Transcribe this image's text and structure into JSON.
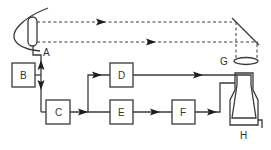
{
  "diagram": {
    "type": "block-flow-optical-schematic",
    "colors": {
      "line": "#3a3a3a",
      "arrow": "#1e1e1e",
      "background": "#ffffff",
      "text": "#333333"
    },
    "labels": {
      "A": "A",
      "B": "B",
      "C": "C",
      "D": "D",
      "E": "E",
      "F": "F",
      "G": "G",
      "H": "H"
    },
    "nodes": [
      {
        "id": "A",
        "kind": "junction-label"
      },
      {
        "id": "B",
        "kind": "box"
      },
      {
        "id": "C",
        "kind": "box"
      },
      {
        "id": "D",
        "kind": "box"
      },
      {
        "id": "E",
        "kind": "box"
      },
      {
        "id": "F",
        "kind": "box"
      },
      {
        "id": "G",
        "kind": "lens"
      },
      {
        "id": "H",
        "kind": "apparatus"
      }
    ],
    "edges": [
      {
        "from": "B",
        "to": "A",
        "style": "solid",
        "arrow": "up"
      },
      {
        "from": "B",
        "to": "C",
        "style": "solid",
        "arrow": "down"
      },
      {
        "from": "C",
        "to": "D",
        "style": "solid",
        "arrow": "right"
      },
      {
        "from": "C",
        "to": "E",
        "style": "solid",
        "arrow": "right"
      },
      {
        "from": "E",
        "to": "F",
        "style": "solid",
        "arrow": "right"
      },
      {
        "from": "F",
        "to": "H",
        "style": "solid",
        "arrow": "right"
      },
      {
        "from": "D",
        "to": "H",
        "style": "solid",
        "arrow": "none"
      },
      {
        "from": "source",
        "to": "mirror",
        "style": "dashed",
        "arrow": "right"
      },
      {
        "from": "mirror",
        "to": "G",
        "style": "dashed",
        "arrow": "none"
      }
    ]
  }
}
